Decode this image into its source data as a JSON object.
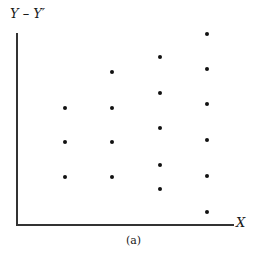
{
  "figure": {
    "y_label": "Y – Y′",
    "x_label": "X",
    "caption": "(a)"
  },
  "chart_data": {
    "type": "scatter",
    "title": "",
    "xlabel": "X",
    "ylabel": "Y – Y′",
    "caption": "(a)",
    "grid": false,
    "legend": null,
    "ticks": "none",
    "points_px": [
      {
        "x": 65,
        "y": 108
      },
      {
        "x": 65,
        "y": 142
      },
      {
        "x": 65,
        "y": 177
      },
      {
        "x": 112,
        "y": 72
      },
      {
        "x": 112,
        "y": 108
      },
      {
        "x": 112,
        "y": 142
      },
      {
        "x": 112,
        "y": 177
      },
      {
        "x": 160,
        "y": 57
      },
      {
        "x": 160,
        "y": 93
      },
      {
        "x": 160,
        "y": 128
      },
      {
        "x": 160,
        "y": 165
      },
      {
        "x": 160,
        "y": 189
      },
      {
        "x": 207,
        "y": 34
      },
      {
        "x": 207,
        "y": 69
      },
      {
        "x": 207,
        "y": 104
      },
      {
        "x": 207,
        "y": 140
      },
      {
        "x": 207,
        "y": 176
      },
      {
        "x": 207,
        "y": 212
      }
    ],
    "series": [
      {
        "name": "column-1",
        "x": 1,
        "values": [
          3.3,
          2.3,
          1.4
        ]
      },
      {
        "name": "column-2",
        "x": 2,
        "values": [
          4.3,
          3.3,
          2.3,
          1.4
        ]
      },
      {
        "name": "column-3",
        "x": 3,
        "values": [
          4.7,
          3.7,
          2.7,
          1.7,
          1.0
        ]
      },
      {
        "name": "column-4",
        "x": 4,
        "values": [
          5.4,
          4.4,
          3.4,
          2.4,
          1.4,
          0.4
        ]
      }
    ]
  }
}
